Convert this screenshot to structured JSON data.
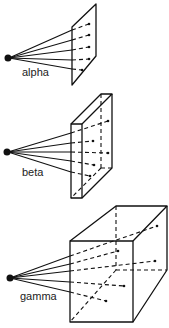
{
  "figure": {
    "colors": {
      "ink": "#111111",
      "background": "#ffffff"
    },
    "panels": [
      {
        "id": "alpha",
        "label": "alpha",
        "target": "thin plane",
        "ray_count": 5
      },
      {
        "id": "beta",
        "label": "beta",
        "target": "thin slab",
        "ray_count": 5
      },
      {
        "id": "gamma",
        "label": "gamma",
        "target": "thick block",
        "ray_count": 5
      }
    ]
  }
}
